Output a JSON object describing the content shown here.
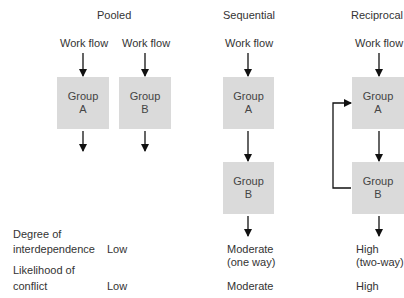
{
  "columns": [
    {
      "title": "Pooled",
      "workflow_labels": [
        "Work flow",
        "Work flow"
      ],
      "groups": [
        {
          "line1": "Group",
          "line2": "A"
        },
        {
          "line1": "Group",
          "line2": "B"
        }
      ]
    },
    {
      "title": "Sequential",
      "workflow_labels": [
        "Work flow"
      ],
      "groups": [
        {
          "line1": "Group",
          "line2": "A"
        },
        {
          "line1": "Group",
          "line2": "B"
        }
      ]
    },
    {
      "title": "Reciprocal",
      "workflow_labels": [
        "Work flow"
      ],
      "groups": [
        {
          "line1": "Group",
          "line2": "A"
        },
        {
          "line1": "Group",
          "line2": "B"
        }
      ]
    }
  ],
  "rows": [
    {
      "label_line1": "Degree of",
      "label_line2": "interdependence",
      "values": [
        {
          "line1": "Low",
          "line2": ""
        },
        {
          "line1": "Moderate",
          "line2": "(one way)"
        },
        {
          "line1": "High",
          "line2": "(two-way)"
        }
      ]
    },
    {
      "label_line1": "Likelihood of",
      "label_line2": "conflict",
      "values": [
        {
          "line1": "Low"
        },
        {
          "line1": "Moderate"
        },
        {
          "line1": "High"
        }
      ]
    }
  ],
  "colors": {
    "box": "#dadada",
    "arrow": "#111111",
    "text": "#333333"
  }
}
